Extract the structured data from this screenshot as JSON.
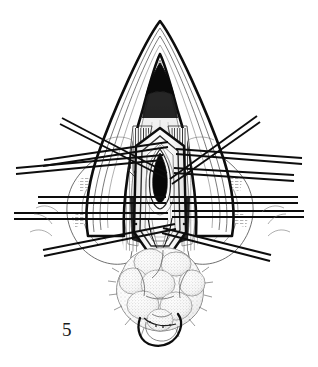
{
  "figure": {
    "number_label": "5",
    "caption": "",
    "medium": "pen-and-ink line drawing",
    "background_color": "#ffffff",
    "ink_color": "#111111",
    "mid_tone_color": "#6e6e6e",
    "light_tone_color": "#bdbdbd",
    "width_px": 318,
    "height_px": 367
  },
  "illustration": {
    "title": "",
    "subject": "surgical exposure with radiating retraction sutures",
    "parts": [
      {
        "name": "outer-apex-cone",
        "label": "",
        "description": "tall pointed inverted-V outer tissue margin forming the apex of the field",
        "apex_point": [
          160,
          21
        ],
        "left_base": [
          92,
          205
        ],
        "right_base": [
          228,
          205
        ]
      },
      {
        "name": "inner-nested-contours",
        "label": "",
        "description": "nested thin contour lines following inside the apex cone",
        "count": 4
      },
      {
        "name": "dark-apex-notch",
        "label": "",
        "description": "solid black inverted-V shadow just under the apex",
        "top": [
          160,
          66
        ],
        "bottom": [
          160,
          88
        ]
      },
      {
        "name": "central-shield",
        "label": "",
        "description": "hexagonal shield-shaped central opening bounded by thick ink outline",
        "top": [
          160,
          128
        ],
        "bottom": [
          160,
          252
        ]
      },
      {
        "name": "central-lumen",
        "label": "",
        "description": "solid black vertical almond/lens shaped lumen at the center",
        "center": [
          160,
          177
        ],
        "width_px": 15,
        "height_px": 48
      },
      {
        "name": "lobulated-mass",
        "label": "",
        "description": "stippled lobulated glandular mass occupying the lower field",
        "center": [
          160,
          292
        ],
        "lobes": 7
      },
      {
        "name": "lower-clamp-loop",
        "label": "",
        "description": "rounded U-shaped dark instrument loop below the mass",
        "center": [
          158,
          333
        ]
      },
      {
        "name": "lateral-tissue-flaps",
        "label": "",
        "description": "retracted lateral tissue flaps with fine hatching, left and right"
      }
    ],
    "retractors": [
      {
        "name": "retractor-upper-left",
        "side": "left",
        "x1": 60,
        "y1": 124,
        "x2": 166,
        "y2": 178
      },
      {
        "name": "retractor-mid-upper-left",
        "side": "left",
        "x1": 43,
        "y1": 164,
        "x2": 168,
        "y2": 145
      },
      {
        "name": "retractor-mid-left",
        "side": "left",
        "x1": 18,
        "y1": 171,
        "x2": 163,
        "y2": 158
      },
      {
        "name": "retractor-center-left",
        "side": "left",
        "x1": 38,
        "y1": 200,
        "x2": 166,
        "y2": 200
      },
      {
        "name": "retractor-lower-left",
        "side": "left",
        "x1": 16,
        "y1": 216,
        "x2": 168,
        "y2": 216
      },
      {
        "name": "retractor-bottom-left",
        "side": "left",
        "x1": 46,
        "y1": 253,
        "x2": 176,
        "y2": 226
      },
      {
        "name": "retractor-upper-right",
        "side": "right",
        "x1": 258,
        "y1": 120,
        "x2": 172,
        "y2": 182
      },
      {
        "name": "retractor-mid-right",
        "side": "right",
        "x1": 300,
        "y1": 162,
        "x2": 176,
        "y2": 152
      },
      {
        "name": "retractor-center-right",
        "side": "right",
        "x1": 292,
        "y1": 178,
        "x2": 172,
        "y2": 170
      },
      {
        "name": "retractor-lower-right",
        "side": "right",
        "x1": 296,
        "y1": 200,
        "x2": 170,
        "y2": 200
      },
      {
        "name": "retractor-bottom-right",
        "side": "right",
        "x1": 300,
        "y1": 214,
        "x2": 172,
        "y2": 214
      },
      {
        "name": "retractor-bottom-far-right",
        "side": "right",
        "x1": 268,
        "y1": 258,
        "x2": 160,
        "y2": 230
      }
    ]
  }
}
